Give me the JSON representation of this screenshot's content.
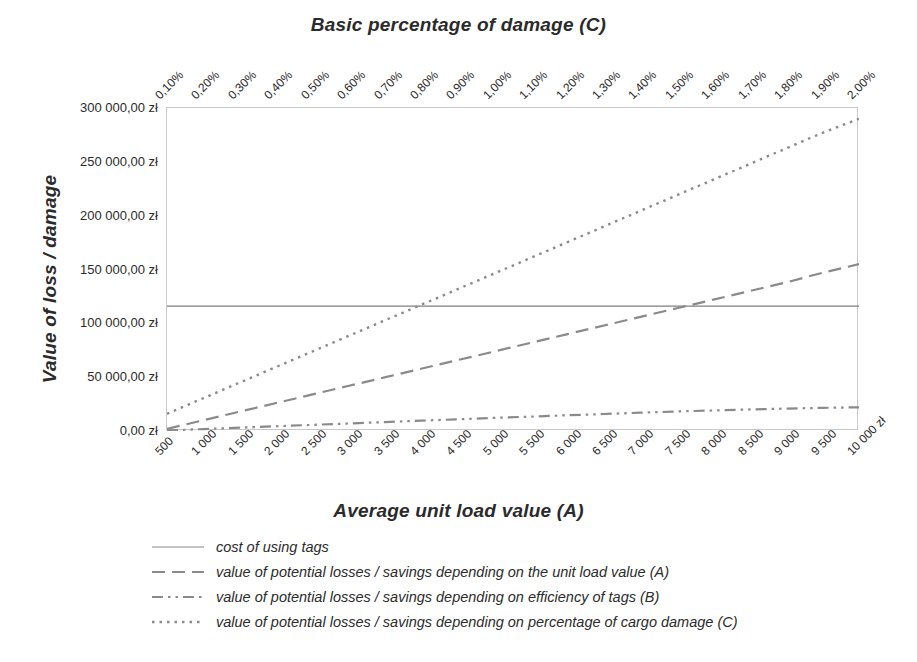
{
  "chart_data": {
    "type": "line",
    "title": "Basic percentage of damage (C)",
    "top_axis_label": "Basic percentage of damage (C)",
    "xlabel": "Average unit load value (A)",
    "ylabel": "Value of loss / damage",
    "grid": false,
    "legend_position": "bottom-left",
    "ylim": [
      0,
      300000
    ],
    "yticks": [
      0,
      50000,
      100000,
      150000,
      200000,
      250000,
      300000
    ],
    "ytick_labels": [
      "0,00 zł",
      "50 000,00 zł",
      "100 000,00 zł",
      "150 000,00 zł",
      "200 000,00 zł",
      "250 000,00 zł",
      "300 000,00 zł"
    ],
    "categories": [
      "500",
      "1 000",
      "1 500",
      "2 000",
      "2 500",
      "3 000",
      "3 500",
      "4 000",
      "4 500",
      "5 000",
      "5 500",
      "6 000",
      "6 500",
      "7 000",
      "7 500",
      "8 000",
      "8 500",
      "9 000",
      "9 500",
      "10 000 zł"
    ],
    "top_categories": [
      "0,10%",
      "0,20%",
      "0,30%",
      "0,40%",
      "0,50%",
      "0,60%",
      "0,70%",
      "0,80%",
      "0,90%",
      "1,00%",
      "1,10%",
      "1,20%",
      "1,30%",
      "1,40%",
      "1,50%",
      "1,60%",
      "1,70%",
      "1,80%",
      "1,90%",
      "2,00%"
    ],
    "series": [
      {
        "name": "cost of using tags",
        "style": "solid",
        "color": "#7f7f7f",
        "values": [
          116000,
          116000,
          116000,
          116000,
          116000,
          116000,
          116000,
          116000,
          116000,
          116000,
          116000,
          116000,
          116000,
          116000,
          116000,
          116000,
          116000,
          116000,
          116000,
          116000
        ]
      },
      {
        "name": "value of potential losses / savings depending on the unit load value (A)",
        "style": "dashed",
        "color": "#8a8a8a",
        "values": [
          2000,
          10000,
          18000,
          26000,
          34000,
          42000,
          50000,
          58000,
          66000,
          74000,
          82000,
          90000,
          98000,
          106000,
          114000,
          122000,
          130000,
          138000,
          147000,
          155000
        ]
      },
      {
        "name": "value of potential losses / savings depending on efficiency of tags (B)",
        "style": "dashdot",
        "color": "#8a8a8a",
        "values": [
          500,
          1800,
          3100,
          4400,
          5700,
          7000,
          8300,
          9600,
          10900,
          12200,
          13400,
          14600,
          15800,
          17000,
          18100,
          19100,
          20000,
          20800,
          21500,
          22000
        ]
      },
      {
        "name": "value of potential losses / savings depending on percentage of cargo damage (C)",
        "style": "dotted",
        "color": "#8a8a8a",
        "values": [
          16000,
          30500,
          45000,
          59500,
          74000,
          88500,
          103000,
          117500,
          132000,
          146500,
          161000,
          175500,
          190000,
          204500,
          219000,
          233500,
          248000,
          262500,
          277000,
          290000
        ]
      }
    ]
  },
  "legend": {
    "items": [
      {
        "label": "cost of using tags",
        "style": "solid"
      },
      {
        "label": "value of potential losses / savings depending on the unit load value (A)",
        "style": "dashed"
      },
      {
        "label": "value of potential losses / savings depending on efficiency of tags (B)",
        "style": "dashdot"
      },
      {
        "label": "value of potential losses / savings depending on percentage of cargo damage (C)",
        "style": "dotted"
      }
    ]
  },
  "colors": {
    "line": "#8a8a8a",
    "frame": "#c9c9c9",
    "text": "#2b2b2b",
    "background": "#ffffff"
  }
}
